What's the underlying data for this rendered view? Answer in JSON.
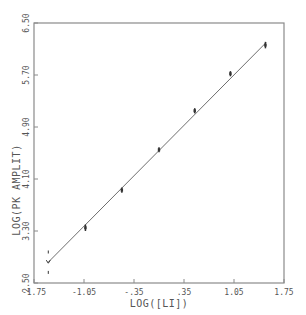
{
  "chart_data": {
    "type": "scatter",
    "title": "",
    "xlabel": "LOG([LI])",
    "ylabel": "LOG(PK AMPLIT)",
    "xlim": [
      -1.75,
      1.75
    ],
    "ylim": [
      2.5,
      6.5
    ],
    "x_ticks": [
      "-1.75",
      "-1.05",
      "-.35",
      ".35",
      "1.05",
      "1.75"
    ],
    "y_ticks": [
      "2.50",
      "3.30",
      "4.10",
      "4.90",
      "5.70",
      "6.50"
    ],
    "grid": false,
    "legend": null,
    "series": [
      {
        "name": "data",
        "style": "points with error bars",
        "x": [
          -1.55,
          -1.03,
          -0.52,
          0.0,
          0.5,
          1.0,
          1.49
        ],
        "y": [
          2.82,
          3.35,
          3.93,
          4.55,
          5.15,
          5.72,
          6.16
        ],
        "error": [
          0.18,
          0.05,
          0.04,
          0.04,
          0.04,
          0.04,
          0.05
        ]
      },
      {
        "name": "linear fit",
        "style": "line",
        "x": [
          -1.55,
          1.5
        ],
        "y": [
          2.82,
          6.2
        ]
      }
    ]
  },
  "colors": {
    "axis": "#8a8a8a",
    "line": "#6e6e6e",
    "points": "#333333",
    "text": "#555555"
  }
}
